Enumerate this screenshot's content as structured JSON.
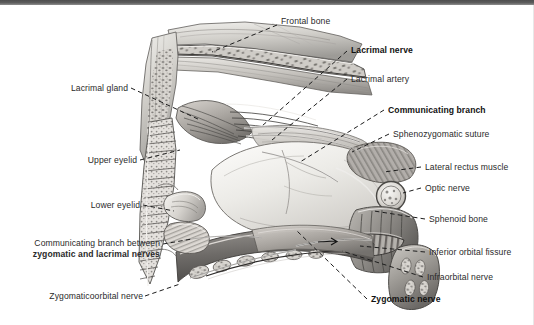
{
  "figure": {
    "type": "anatomical-illustration",
    "style": "grayscale pencil / halftone medical illustration",
    "top_bar_color": "#555555",
    "background_color": "#ffffff",
    "text_color": "#2a2a2a",
    "leader_line_color": "#1d1d1d"
  },
  "labels": {
    "frontal_bone": "Frontal bone",
    "lacrimal_nerve": "Lacrimal nerve",
    "lacrimal_artery": "Lacrimal artery",
    "communicating_branch": "Communicating branch",
    "sphenozygomatic_suture": "Sphenozygomatic suture",
    "lateral_rectus_muscle": "Lateral rectus muscle",
    "optic_nerve": "Optic nerve",
    "sphenoid_bone": "Sphenoid bone",
    "inferior_orbital_fissure": "Inferior orbital fissure",
    "infraorbital_nerve": "Infraorbital nerve",
    "zygomatic_nerve": "Zygomatic nerve",
    "lacrimal_gland": "Lacrimal gland",
    "upper_eyelid": "Upper eyelid",
    "lower_eyelid": "Lower eyelid",
    "communicating_branch_between_line1": "Communicating branch between",
    "communicating_branch_between_line2": "zygomatic and lacrimal nerves",
    "zygomaticoorbital_nerve": "Zygomaticoorbital nerve"
  },
  "emphasis": {
    "bold_labels": [
      "Lacrimal nerve",
      "Communicating branch",
      "Zygomatic nerve",
      "zygomatic and lacrimal nerves"
    ]
  }
}
